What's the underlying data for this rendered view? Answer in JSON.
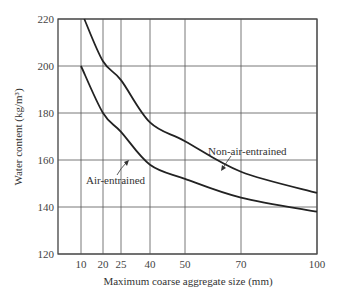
{
  "chart_data": {
    "type": "line",
    "title": "",
    "xlabel": "Maximum coarse aggregate size (mm)",
    "ylabel": "Water content (kg/m³)",
    "x_ticks": [
      10,
      20,
      25,
      40,
      50,
      70,
      100
    ],
    "y_ticks": [
      120,
      140,
      160,
      180,
      200,
      220
    ],
    "ylim": [
      120,
      220
    ],
    "grid": true,
    "series": [
      {
        "name": "Non-air-entrained",
        "x": [
          11.5,
          20,
          25,
          40,
          50,
          70,
          100
        ],
        "values": [
          220,
          202,
          194,
          176,
          168,
          155,
          146
        ]
      },
      {
        "name": "Air-entrained",
        "x": [
          10,
          20,
          25,
          40,
          50,
          70,
          100
        ],
        "values": [
          200,
          180,
          172,
          158,
          152,
          144,
          138
        ]
      }
    ],
    "annotations": [
      "Non-air-entrained",
      "Air-entrained"
    ]
  }
}
